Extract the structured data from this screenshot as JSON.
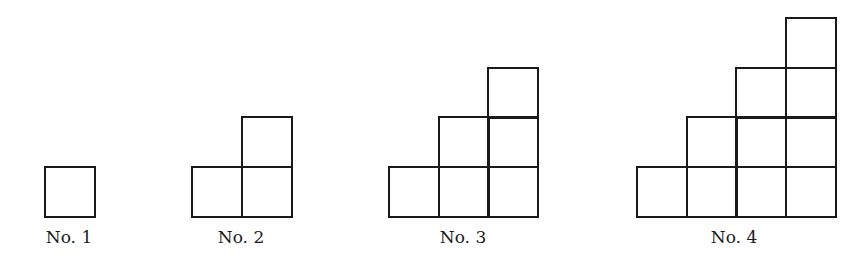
{
  "diagram": {
    "cell_size": 49.5,
    "baseline_y": 215,
    "stroke_color": "#1a1a1a",
    "background": "#ffffff",
    "figures": [
      {
        "label": "No. 1",
        "left_x": 44,
        "columns": [
          1
        ],
        "label_center_x": 69
      },
      {
        "label": "No. 2",
        "left_x": 191,
        "columns": [
          1,
          2
        ],
        "label_center_x": 241
      },
      {
        "label": "No. 3",
        "left_x": 388,
        "columns": [
          1,
          2,
          3
        ],
        "label_center_x": 463
      },
      {
        "label": "No. 4",
        "left_x": 636,
        "columns": [
          1,
          2,
          3,
          4
        ],
        "label_center_x": 734
      }
    ]
  }
}
